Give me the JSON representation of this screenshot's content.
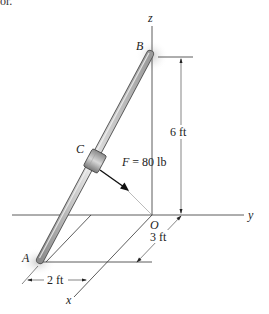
{
  "header_fragment": "or.",
  "figure": {
    "axes": {
      "x": "x",
      "y": "y",
      "z": "z"
    },
    "points": {
      "origin": "O",
      "A": "A",
      "B": "B",
      "C": "C"
    },
    "force_label": "F = 80 lb",
    "dimensions": {
      "height": "6 ft",
      "depth": "3 ft",
      "width": "2 ft"
    },
    "colors": {
      "rod": "#b8b8b8",
      "rod_edge": "#555555",
      "lines": "#333333",
      "arrow": "#111111"
    }
  }
}
